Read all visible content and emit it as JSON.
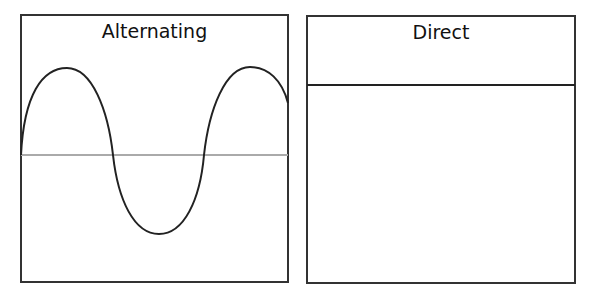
{
  "panels": [
    {
      "title": "Alternating",
      "type": "sine-wave"
    },
    {
      "title": "Direct",
      "type": "flat-line"
    }
  ],
  "colors": {
    "line": "#222222",
    "axis": "#aaaaaa",
    "border": "#333333"
  }
}
